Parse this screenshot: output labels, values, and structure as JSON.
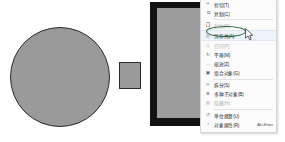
{
  "app": {
    "title": "Drawing canvas with context menu",
    "background_color": "#ffffff"
  },
  "canvas": {
    "shapes": [
      {
        "name": "large-circle",
        "type": "circle",
        "fill": "#9a9a9a",
        "stroke": "#2b2b2b"
      },
      {
        "name": "small-rectangle",
        "type": "rectangle",
        "fill": "#9a9a9a",
        "stroke": "#2b2b2b"
      }
    ],
    "panel": {
      "name": "framed-image-panel",
      "frame_color": "#121212",
      "fill": "#9c9c9c"
    }
  },
  "context_menu": {
    "items": [
      {
        "icon": "cut-icon",
        "label": "剪切(T)",
        "accel": "",
        "disabled": false,
        "highlight": false,
        "separator_after": false
      },
      {
        "icon": "copy-icon",
        "label": "复制(C)",
        "accel": "",
        "disabled": false,
        "highlight": false,
        "separator_after": true
      },
      {
        "icon": "paste-icon",
        "label": "粘贴(P)",
        "accel": "",
        "disabled": true,
        "highlight": false,
        "separator_after": false
      },
      {
        "icon": "save-as-icon",
        "label": "另存为(A)",
        "accel": "",
        "disabled": false,
        "highlight": true,
        "separator_after": false
      },
      {
        "icon": "print-icon",
        "label": "打印(P)",
        "accel": "",
        "disabled": true,
        "highlight": false,
        "separator_after": false
      },
      {
        "icon": "rotate-icon",
        "label": "平移(M)",
        "accel": "",
        "disabled": false,
        "highlight": false,
        "separator_after": false
      },
      {
        "icon": "resize-icon",
        "label": "缩放(Z)",
        "accel": "",
        "disabled": false,
        "highlight": false,
        "separator_after": false
      },
      {
        "icon": "layer-icon",
        "label": "组合对象(G)",
        "accel": "",
        "disabled": false,
        "highlight": false,
        "separator_after": true
      },
      {
        "icon": "split-icon",
        "label": "拆分(S)",
        "accel": "",
        "disabled": false,
        "highlight": false,
        "separator_after": false
      },
      {
        "icon": "align-icon",
        "label": "多种子对象(B)",
        "accel": "",
        "disabled": false,
        "highlight": false,
        "separator_after": false
      },
      {
        "icon": "group-icon",
        "label": "隐藏(H)",
        "accel": "",
        "disabled": true,
        "highlight": false,
        "separator_after": true
      },
      {
        "icon": "refresh-icon",
        "label": "单位换算(U)",
        "accel": "",
        "disabled": false,
        "highlight": false,
        "separator_after": false
      },
      {
        "icon": "properties-icon",
        "label": "对象属性(R)",
        "accel": "Alt+Enter",
        "disabled": false,
        "highlight": false,
        "separator_after": false
      }
    ]
  },
  "annotation": {
    "name": "highlight-ellipse",
    "color": "#1f5c32",
    "target_label": "另存为(A)"
  },
  "cursor": {
    "name": "mouse-pointer",
    "color": "#ffffff",
    "outline": "#1a1a1a"
  }
}
